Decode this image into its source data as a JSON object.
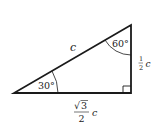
{
  "diagram": {
    "type": "right-triangle",
    "angles": {
      "left": "30°",
      "top": "60°",
      "bottom_right": "90°"
    },
    "sides": {
      "hypotenuse": {
        "label": "c"
      },
      "vertical_leg": {
        "numerator": "1",
        "denominator": "2",
        "variable": "c"
      },
      "horizontal_leg": {
        "radical": "3",
        "denominator": "2",
        "variable": "c",
        "sqrt_symbol": "√"
      }
    },
    "colors": {
      "stroke": "#1a1a1a",
      "background": "#ffffff"
    }
  }
}
